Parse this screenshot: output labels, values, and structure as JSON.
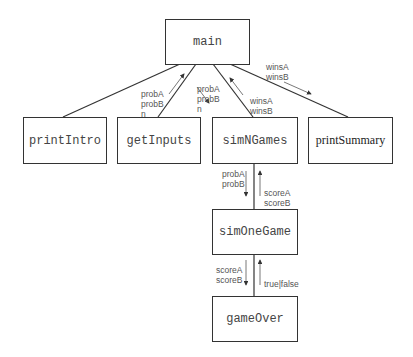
{
  "nodes": {
    "main": "main",
    "printIntro": "printIntro",
    "getInputs": "getInputs",
    "simNGames": "simNGames",
    "printSummary": "printSummary",
    "simOneGame": "simOneGame",
    "gameOver": "gameOver"
  },
  "labels": {
    "getInputs_to_main": "probA\nprobB\nn",
    "main_to_simNGames": "probA\nprobB\nn",
    "simNGames_to_main": "winsA\nwinsB",
    "main_to_printSummary": "winsA\nwinsB",
    "simNGames_to_simOneGame": "probA\nprobB",
    "simOneGame_to_simNGames": "scoreA\nscoreB",
    "simOneGame_to_gameOver": "scoreA\nscoreB",
    "gameOver_to_simOneGame": "true|false"
  }
}
